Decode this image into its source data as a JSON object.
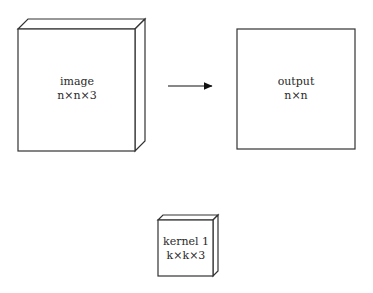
{
  "diagram": {
    "image_block": {
      "label": "image",
      "dims": "n×n×3"
    },
    "arrow": {
      "direction": "right"
    },
    "output_block": {
      "label": "output",
      "dims": "n×n"
    },
    "kernel_block": {
      "label": "kernel 1",
      "dims": "k×k×3"
    }
  },
  "colors": {
    "stroke": "#333333",
    "fill": "#ffffff",
    "text": "#2a2a2a"
  }
}
